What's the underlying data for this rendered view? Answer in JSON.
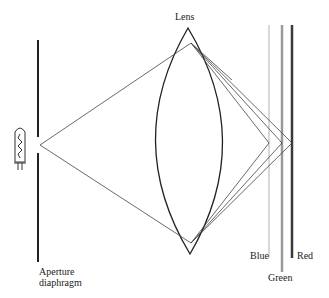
{
  "labels": {
    "lens": "Lens",
    "aperture_line1": "Aperture",
    "aperture_line2": "diaphragm",
    "blue": "Blue",
    "green": "Green",
    "red": "Red"
  },
  "colors": {
    "blue_plane": "#d8d8d8",
    "green_plane": "#9a9a9a",
    "red_plane": "#3a3a3a",
    "ink": "#222222"
  }
}
